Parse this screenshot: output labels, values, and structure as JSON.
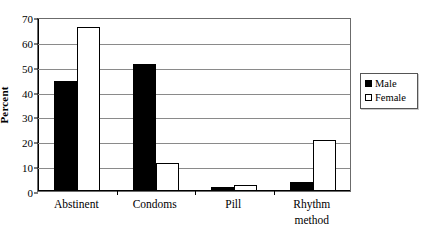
{
  "chart_data": {
    "type": "bar",
    "title": "",
    "xlabel": "",
    "ylabel": "Percent",
    "ylim": [
      0,
      70
    ],
    "ytick_step": 10,
    "yticks": [
      0,
      10,
      20,
      30,
      40,
      50,
      60,
      70
    ],
    "ytick_labels": [
      "0",
      "10",
      "20",
      "30",
      "40",
      "50",
      "60",
      "70"
    ],
    "grid": true,
    "grid_axis": "y",
    "legend_position": "right",
    "categories": [
      "Abstinent",
      "Condoms",
      "Pill",
      "Rhythm\nmethod"
    ],
    "series": [
      {
        "name": "Male",
        "color": "#000000",
        "values": [
          44.3,
          51.0,
          1.7,
          3.5
        ]
      },
      {
        "name": "Female",
        "color": "#ffffff",
        "values": [
          65.8,
          11.4,
          2.3,
          20.7
        ]
      }
    ]
  },
  "axes": {
    "y_title": "Percent",
    "y_labels": [
      "70",
      "60",
      "50",
      "40",
      "30",
      "20",
      "10",
      "0"
    ],
    "x_labels": [
      "Abstinent",
      "Condoms",
      "Pill",
      "Rhythm\nmethod"
    ]
  },
  "legend": {
    "items": [
      {
        "label": "Male",
        "swatch": "filled-black-square"
      },
      {
        "label": "Female",
        "swatch": "open-white-square"
      }
    ]
  }
}
